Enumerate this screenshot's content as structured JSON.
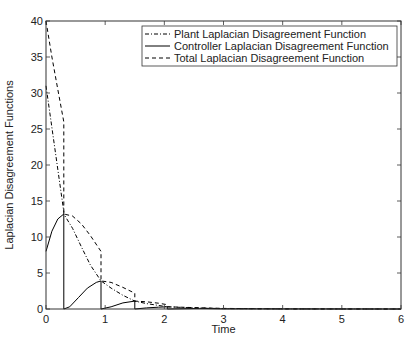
{
  "chart_data": {
    "type": "line",
    "title": "",
    "xlabel": "Time",
    "ylabel": "Laplacian Disagreement Functions",
    "xlim": [
      0,
      6
    ],
    "ylim": [
      0,
      40
    ],
    "xticks": [
      0,
      1,
      2,
      3,
      4,
      5,
      6
    ],
    "yticks": [
      0,
      5,
      10,
      15,
      20,
      25,
      30,
      35,
      40
    ],
    "grid": false,
    "legend_position": "upper right",
    "series": [
      {
        "name": "Plant Laplacian Disagreement Function",
        "style": "dashdot",
        "points": [
          [
            0,
            31
          ],
          [
            0.3,
            13.5
          ],
          [
            0.3,
            13.2
          ],
          [
            0.45,
            11.2
          ],
          [
            0.6,
            8.6
          ],
          [
            0.75,
            6.1
          ],
          [
            0.93,
            3.9
          ],
          [
            1.1,
            2.9
          ],
          [
            1.3,
            1.9
          ],
          [
            1.5,
            1.1
          ],
          [
            1.7,
            0.75
          ],
          [
            1.9,
            0.5
          ],
          [
            2.05,
            0.3
          ],
          [
            2.5,
            0.15
          ],
          [
            3,
            0.05
          ],
          [
            4,
            0.01
          ],
          [
            6,
            0
          ]
        ]
      },
      {
        "name": "Controller Laplacian Disagreement Function",
        "style": "solid",
        "points": [
          [
            0,
            8
          ],
          [
            0.1,
            10.8
          ],
          [
            0.2,
            12.5
          ],
          [
            0.3,
            13.2
          ],
          [
            0.3,
            0
          ],
          [
            0.4,
            0.3
          ],
          [
            0.55,
            1.6
          ],
          [
            0.7,
            2.9
          ],
          [
            0.85,
            3.7
          ],
          [
            0.93,
            3.9
          ],
          [
            0.93,
            0
          ],
          [
            1.1,
            0.3
          ],
          [
            1.3,
            0.85
          ],
          [
            1.5,
            1.1
          ],
          [
            1.5,
            0
          ],
          [
            1.7,
            0.15
          ],
          [
            1.9,
            0.25
          ],
          [
            2.05,
            0.3
          ],
          [
            2.05,
            0
          ],
          [
            2.6,
            0.08
          ],
          [
            3,
            0.03
          ],
          [
            4,
            0.01
          ],
          [
            6,
            0
          ]
        ]
      },
      {
        "name": "Total Laplacian Disagreement Function",
        "style": "dashed",
        "points": [
          [
            0,
            40
          ],
          [
            0.1,
            35
          ],
          [
            0.2,
            30.5
          ],
          [
            0.3,
            26
          ],
          [
            0.3,
            13.2
          ],
          [
            0.45,
            12.9
          ],
          [
            0.6,
            11.8
          ],
          [
            0.75,
            10.2
          ],
          [
            0.93,
            8
          ],
          [
            0.93,
            3.9
          ],
          [
            1.1,
            3.7
          ],
          [
            1.3,
            3.0
          ],
          [
            1.5,
            2.2
          ],
          [
            1.5,
            1.1
          ],
          [
            1.7,
            1.0
          ],
          [
            1.9,
            0.8
          ],
          [
            2.05,
            0.6
          ],
          [
            2.05,
            0.3
          ],
          [
            2.5,
            0.2
          ],
          [
            3,
            0.08
          ],
          [
            4,
            0.02
          ],
          [
            6,
            0
          ]
        ]
      }
    ]
  },
  "plot": {
    "x_label": "Time",
    "y_label": "Laplacian Disagreement Functions",
    "legend": [
      {
        "label": "Plant Laplacian Disagreement Function",
        "style": "dashdot"
      },
      {
        "label": "Controller Laplacian Disagreement Function",
        "style": "solid"
      },
      {
        "label": "Total Laplacian Disagreement Function",
        "style": "dashed"
      }
    ],
    "colors": {
      "line": "#000000",
      "axes": "#333333",
      "background": "#ffffff"
    }
  }
}
